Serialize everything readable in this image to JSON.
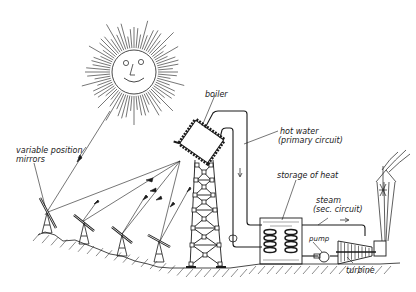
{
  "diagram": {
    "labels": {
      "boiler": "boiler",
      "mirrors_line1": "variable position",
      "mirrors_line2": "mirrors",
      "hot_water_line1": "hot water",
      "hot_water_line2": "(primary circuit)",
      "storage": "storage of heat",
      "steam_line1": "steam",
      "steam_line2": "(sec. circuit)",
      "pump": "pump",
      "turbine": "turbine"
    },
    "components": [
      "sun",
      "heliostat-mirrors",
      "tower",
      "boiler",
      "primary-circuit",
      "heat-storage",
      "secondary-circuit",
      "pump",
      "turbine",
      "generator",
      "power-line-pylon"
    ],
    "mirror_count": 4,
    "colors": {
      "ink": "#1a1a1a",
      "background": "#ffffff"
    }
  }
}
